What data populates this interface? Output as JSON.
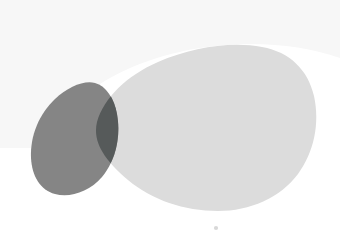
{
  "canvas": {
    "width": 340,
    "height": 244,
    "background_color": "#ffffff",
    "description": "Abstract illustration of two overlapping organic blob shapes in grayscale"
  },
  "palette": {
    "background": "#ffffff",
    "haze": "#f7f7f7",
    "large_blob": "#dcdcdc",
    "dark_blob": "#858585",
    "overlap": "#565a5a",
    "speck": "#d8d8d8"
  },
  "shapes": {
    "haze": {
      "name": "background-haze",
      "fill": "#f7f7f7",
      "opacity": 1,
      "path": "M 0 0 L 340 0 L 340 58 C 300 44 250 40 200 48 C 150 56 110 74 84 96 C 66 112 52 130 42 148 L 0 148 Z"
    },
    "large_blob": {
      "name": "large-light-blob",
      "fill": "#dcdcdc",
      "opacity": 1,
      "bounds": {
        "x": 90,
        "y": 44,
        "width": 226,
        "height": 168
      },
      "path": "M 97 122 C 104 98 126 76 158 62 C 192 47 232 41 262 47 C 290 52 308 70 314 96 C 320 124 314 152 298 174 C 280 198 250 211 218 211 C 184 211 152 200 128 180 C 106 161 92 143 97 122 Z"
    },
    "dark_blob": {
      "name": "dark-teardrop-blob",
      "fill": "#858585",
      "opacity": 1,
      "bounds": {
        "x": 31,
        "y": 82,
        "width": 94,
        "height": 115
      },
      "path": "M 95 83 C 106 86 114 98 117 114 C 121 136 116 160 102 177 C 89 192 70 198 55 194 C 40 190 32 176 31 158 C 30 136 39 114 55 99 C 68 87 84 80 95 83 Z"
    },
    "overlap": {
      "name": "blob-overlap-region",
      "fill": "#565a5a",
      "opacity": 1,
      "description": "Intersection of the dark teardrop blob and the large light blob, rendered as a darker multiply-blend crescent"
    },
    "speck": {
      "name": "speck-dot",
      "fill": "#d8d8d8",
      "cx": 216,
      "cy": 228,
      "r": 2.1
    }
  }
}
